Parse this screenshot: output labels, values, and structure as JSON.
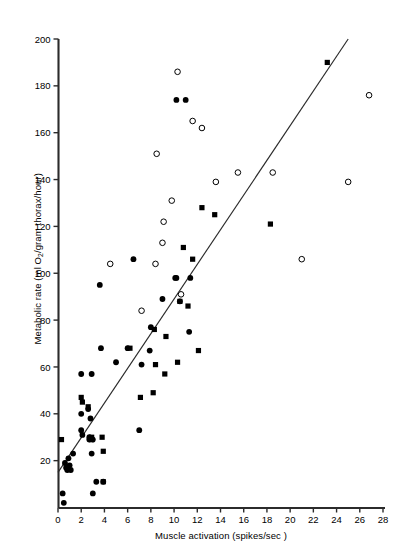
{
  "chart_data": {
    "type": "scatter",
    "title": "",
    "xlabel": "Muscle activation (spikes/sec )",
    "ylabel_parts": {
      "pre": "Metabolic rate (ml O",
      "sub": "2",
      "post": "/gram thorax/hour)"
    },
    "ylabel": "Metabolic rate (ml O2/gram thorax/hour)",
    "xlim": [
      0,
      28
    ],
    "ylim": [
      0,
      200
    ],
    "xticks": [
      0,
      2,
      4,
      6,
      8,
      10,
      12,
      14,
      16,
      18,
      20,
      22,
      24,
      26,
      28
    ],
    "yticks": [
      20,
      40,
      60,
      80,
      100,
      120,
      140,
      160,
      180,
      200
    ],
    "grid": false,
    "legend": "none",
    "marker_color": "#000000",
    "line_color": "#2b2b2b",
    "trendline": {
      "x0": 0,
      "y0": 15,
      "x1": 25,
      "y1": 200
    },
    "series": [
      {
        "name": "filled-circle",
        "marker": "filled-circle",
        "points": [
          [
            0.4,
            6
          ],
          [
            0.5,
            2
          ],
          [
            0.6,
            19
          ],
          [
            0.7,
            17
          ],
          [
            0.8,
            16
          ],
          [
            0.9,
            21
          ],
          [
            1.0,
            18
          ],
          [
            1.1,
            16
          ],
          [
            1.3,
            23
          ],
          [
            2.0,
            57
          ],
          [
            2.0,
            40
          ],
          [
            2.0,
            33
          ],
          [
            2.1,
            31
          ],
          [
            2.6,
            42
          ],
          [
            2.7,
            29
          ],
          [
            2.7,
            30
          ],
          [
            2.8,
            38
          ],
          [
            2.9,
            57
          ],
          [
            2.9,
            23
          ],
          [
            3.0,
            29
          ],
          [
            3.0,
            6
          ],
          [
            3.3,
            11
          ],
          [
            3.6,
            95
          ],
          [
            3.7,
            68
          ],
          [
            3.9,
            11
          ],
          [
            5.0,
            62
          ],
          [
            6.0,
            68
          ],
          [
            7.0,
            33
          ],
          [
            7.2,
            61
          ],
          [
            7.9,
            67
          ],
          [
            8.0,
            77
          ],
          [
            9.0,
            89
          ],
          [
            10.2,
            98
          ],
          [
            10.5,
            88
          ],
          [
            11.3,
            75
          ],
          [
            11.4,
            98
          ],
          [
            6.5,
            106
          ],
          [
            10.1,
            98
          ],
          [
            10.2,
            174
          ],
          [
            11.0,
            174
          ]
        ]
      },
      {
        "name": "filled-square",
        "marker": "filled-square",
        "points": [
          [
            0.3,
            29
          ],
          [
            2.0,
            47
          ],
          [
            2.1,
            45
          ],
          [
            2.6,
            43
          ],
          [
            2.9,
            30
          ],
          [
            2.9,
            29
          ],
          [
            3.8,
            30
          ],
          [
            3.9,
            24
          ],
          [
            3.9,
            11
          ],
          [
            6.2,
            68
          ],
          [
            7.1,
            47
          ],
          [
            8.2,
            49
          ],
          [
            8.3,
            76
          ],
          [
            8.4,
            61
          ],
          [
            9.2,
            57
          ],
          [
            9.3,
            73
          ],
          [
            10.3,
            62
          ],
          [
            10.5,
            88
          ],
          [
            11.2,
            86
          ],
          [
            12.1,
            67
          ],
          [
            10.8,
            111
          ],
          [
            11.6,
            106
          ],
          [
            12.4,
            128
          ],
          [
            13.5,
            125
          ],
          [
            18.3,
            121
          ],
          [
            23.2,
            190
          ]
        ]
      },
      {
        "name": "open-circle",
        "marker": "open-circle",
        "points": [
          [
            4.5,
            104
          ],
          [
            7.2,
            84
          ],
          [
            8.4,
            104
          ],
          [
            9.0,
            113
          ],
          [
            9.1,
            122
          ],
          [
            9.8,
            131
          ],
          [
            8.5,
            151
          ],
          [
            10.3,
            186
          ],
          [
            11.6,
            165
          ],
          [
            12.4,
            162
          ],
          [
            13.6,
            139
          ],
          [
            15.5,
            143
          ],
          [
            18.5,
            143
          ],
          [
            21.0,
            106
          ],
          [
            25.0,
            139
          ],
          [
            26.8,
            176
          ],
          [
            10.6,
            91
          ]
        ]
      }
    ]
  }
}
